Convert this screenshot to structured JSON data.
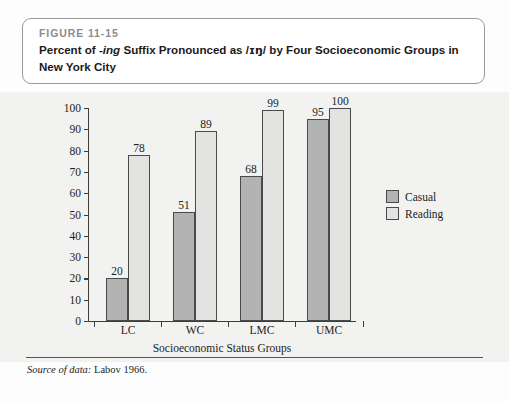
{
  "figure": {
    "number_label": "FIGURE 11-15",
    "title_part1": "Percent of ",
    "title_italic": "-ing",
    "title_part2": " Suffix Pronounced as /",
    "title_ipa": "ɪŋ",
    "title_part3": "/ by Four Socioeconomic Groups in New York City"
  },
  "source": {
    "lead": "Source of data:",
    "text": " Labov 1966."
  },
  "legend": {
    "items": [
      {
        "label": "Casual",
        "color": "#b3b3b3"
      },
      {
        "label": "Reading",
        "color": "#e3e3e1"
      }
    ]
  },
  "chart_data": {
    "type": "bar",
    "title": "Percent of -ing Suffix Pronounced as /ɪŋ/ by Four Socioeconomic Groups in New York City",
    "xlabel": "Socioeconomic Status Groups",
    "ylabel": "",
    "ylim": [
      0,
      100
    ],
    "yticks": [
      0,
      10,
      20,
      30,
      40,
      50,
      60,
      70,
      80,
      90,
      100
    ],
    "grid": false,
    "legend_position": "right",
    "categories": [
      "LC",
      "WC",
      "LMC",
      "UMC"
    ],
    "series": [
      {
        "name": "Casual",
        "color": "#b3b3b3",
        "values": [
          20,
          51,
          68,
          95
        ]
      },
      {
        "name": "Reading",
        "color": "#e3e3e1",
        "values": [
          78,
          89,
          99,
          100
        ]
      }
    ]
  }
}
